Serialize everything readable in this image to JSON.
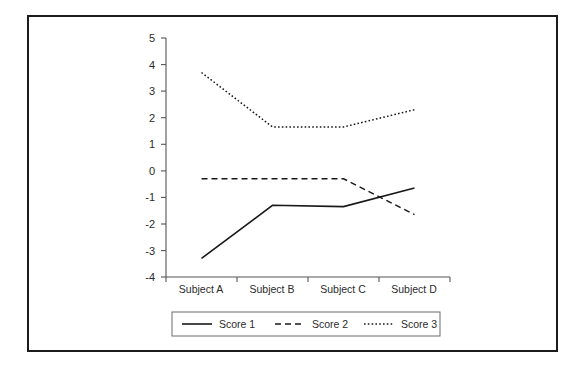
{
  "chart_data": {
    "type": "line",
    "title": "",
    "subtitle": "",
    "xlabel": "",
    "ylabel": "",
    "categories": [
      "Subject A",
      "Subject B",
      "Subject C",
      "Subject D"
    ],
    "series": [
      {
        "name": "Score 1",
        "style": "solid",
        "values": [
          -3.3,
          -1.3,
          -1.35,
          -0.65
        ]
      },
      {
        "name": "Score 2",
        "style": "dashed",
        "values": [
          -0.3,
          -0.3,
          -0.3,
          -1.65
        ]
      },
      {
        "name": "Score 3",
        "style": "dotted",
        "values": [
          3.7,
          1.65,
          1.65,
          2.3
        ]
      }
    ],
    "ylim": [
      -4,
      5
    ],
    "yticks": [
      "5",
      "4",
      "3",
      "2",
      "1",
      "0",
      "-1",
      "-2",
      "-3",
      "-4"
    ],
    "grid": false,
    "legend_position": "bottom",
    "colors": {
      "line": "#191919",
      "axis": "#555555",
      "frame": "#1c1c1c",
      "background": "#ffffff"
    }
  },
  "axis": {
    "y_tick_0": "5",
    "y_tick_1": "4",
    "y_tick_2": "3",
    "y_tick_3": "2",
    "y_tick_4": "1",
    "y_tick_5": "0",
    "y_tick_6": "-1",
    "y_tick_7": "-2",
    "y_tick_8": "-3",
    "y_tick_9": "-4"
  },
  "categories": {
    "c0": "Subject A",
    "c1": "Subject B",
    "c2": "Subject C",
    "c3": "Subject D"
  },
  "legend": {
    "items": [
      {
        "label": "Score 1"
      },
      {
        "label": "Score 2"
      },
      {
        "label": "Score 3"
      }
    ]
  }
}
